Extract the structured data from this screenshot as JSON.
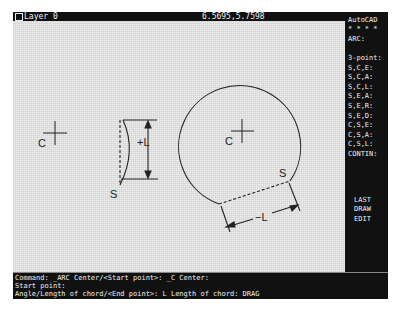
{
  "status_bar": {
    "layer": "Layer 0",
    "coordinates": "6.5695,5.7598"
  },
  "side_menu": {
    "items": [
      {
        "label": "AutoCAD",
        "top": 4
      },
      {
        "label": "* * * *",
        "top": 13
      },
      {
        "label": "ARC:",
        "top": 23
      },
      {
        "label": "3-point:",
        "top": 42
      },
      {
        "label": "S,C,E:",
        "top": 52
      },
      {
        "label": "S,C,A:",
        "top": 61
      },
      {
        "label": "S,C,L:",
        "top": 71
      },
      {
        "label": "S,E,A:",
        "top": 80
      },
      {
        "label": "S,E,R:",
        "top": 90
      },
      {
        "label": "S,E,D:",
        "top": 100
      },
      {
        "label": "C,S,E:",
        "top": 109
      },
      {
        "label": "C,S,A:",
        "top": 119
      },
      {
        "label": "C,S,L:",
        "top": 128
      },
      {
        "label": "CONTIN:",
        "top": 138
      },
      {
        "label": "LAST",
        "top": 184
      },
      {
        "label": "DRAW",
        "top": 193
      },
      {
        "label": "EDIT",
        "top": 203
      }
    ]
  },
  "command_area": {
    "lines": [
      "Command: _ARC Center/<Start point>: _C Center:",
      "Start point:",
      "Angle/Length of chord/<End point>: L Length of chord: DRAG"
    ]
  },
  "drawing": {
    "labels": {
      "center_left": "C",
      "center_circle": "C",
      "start_left": "S",
      "start_circle": "S",
      "positive_chord": "+L",
      "negative_chord": "−L"
    }
  },
  "colors": {
    "screen_bg": "#111111",
    "drawing_bg": "#ececec",
    "text": "#f0f0f0",
    "line": "#222222"
  }
}
